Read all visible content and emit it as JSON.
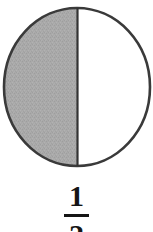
{
  "figure": {
    "kind": "fraction-circle-diagram",
    "caption_value": "1/2"
  },
  "diagram": {
    "shape_name": "circle",
    "total_parts": 2,
    "shaded_parts": 1,
    "divider_orientation": "vertical",
    "shaded_side": "left",
    "unshaded_side": "right",
    "outline_color": "#3a3a3a",
    "shaded_fill_color": "#a8a8a8",
    "unshaded_fill_color": "#ffffff",
    "divider_color": "#333333"
  },
  "fraction": {
    "numerator": "1",
    "denominator": "2",
    "bar_color": "#151515",
    "text_color": "#151515"
  }
}
